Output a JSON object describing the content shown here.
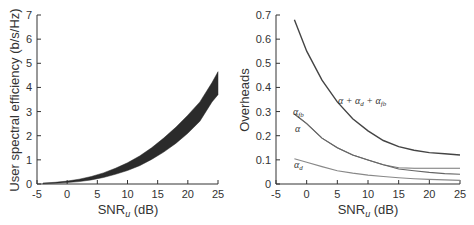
{
  "chart_data": [
    {
      "type": "area",
      "title": "",
      "xlabel": "SNR_u (dB)",
      "ylabel": "User spectral efficiency (b/s/Hz)",
      "xlim": [
        -5,
        25
      ],
      "ylim": [
        0,
        7
      ],
      "xticks": [
        -5,
        0,
        5,
        10,
        15,
        20,
        25
      ],
      "yticks": [
        0,
        1,
        2,
        3,
        4,
        5,
        6,
        7
      ],
      "grid": false,
      "legend": null,
      "x": [
        -4,
        -2,
        0,
        2,
        4,
        6,
        8,
        10,
        12,
        14,
        16,
        18,
        20,
        22,
        24,
        25
      ],
      "series": [
        {
          "name": "upper bound",
          "values": [
            0.04,
            0.07,
            0.12,
            0.2,
            0.31,
            0.46,
            0.65,
            0.88,
            1.16,
            1.5,
            1.9,
            2.35,
            2.85,
            3.4,
            4.2,
            4.65
          ]
        },
        {
          "name": "lower bound",
          "values": [
            0.01,
            0.03,
            0.06,
            0.1,
            0.17,
            0.27,
            0.4,
            0.56,
            0.76,
            1.02,
            1.32,
            1.68,
            2.1,
            2.6,
            3.4,
            3.7
          ]
        }
      ]
    },
    {
      "type": "line",
      "title": "",
      "xlabel": "SNR_u (dB)",
      "ylabel": "Overheads",
      "xlim": [
        -5,
        25
      ],
      "ylim": [
        0,
        0.7
      ],
      "xticks": [
        -5,
        0,
        5,
        10,
        15,
        20,
        25
      ],
      "yticks": [
        0,
        0.1,
        0.2,
        0.3,
        0.4,
        0.5,
        0.6,
        0.7
      ],
      "grid": false,
      "legend": null,
      "x": [
        -2,
        0,
        2.5,
        5,
        7.5,
        10,
        12.5,
        15,
        17.5,
        20,
        22.5,
        25
      ],
      "series": [
        {
          "name": "α + α_d + α_fb",
          "values": [
            0.68,
            0.55,
            0.43,
            0.34,
            0.27,
            0.22,
            0.18,
            0.155,
            0.14,
            0.13,
            0.125,
            0.12
          ]
        },
        {
          "name": "α_fb",
          "values": [
            0.29,
            0.25,
            0.19,
            0.15,
            0.12,
            0.1,
            0.08,
            0.067,
            0.065,
            0.065,
            0.065,
            0.065
          ]
        },
        {
          "name": "α",
          "values": [
            0.29,
            0.25,
            0.19,
            0.15,
            0.12,
            0.1,
            0.08,
            0.062,
            0.055,
            0.048,
            0.043,
            0.04
          ]
        },
        {
          "name": "α_d",
          "values": [
            0.105,
            0.09,
            0.072,
            0.055,
            0.045,
            0.037,
            0.031,
            0.026,
            0.022,
            0.019,
            0.017,
            0.015
          ]
        }
      ],
      "annotations": [
        "α + α_d + α_fb",
        "α_fb",
        "α",
        "α_d"
      ]
    }
  ],
  "left": {
    "ylabel": "User spectral efficiency (b/s/Hz)",
    "xlabel_main": "SNR",
    "xlabel_sub": "u",
    "xlabel_unit": " (dB)",
    "xticks": [
      "-5",
      "0",
      "5",
      "10",
      "15",
      "20",
      "25"
    ],
    "yticks": [
      "0",
      "1",
      "2",
      "3",
      "4",
      "5",
      "6",
      "7"
    ]
  },
  "right": {
    "ylabel": "Overheads",
    "xlabel_main": "SNR",
    "xlabel_sub": "u",
    "xlabel_unit": " (dB)",
    "xticks": [
      "-5",
      "0",
      "5",
      "10",
      "15",
      "20",
      "25"
    ],
    "yticks": [
      "0",
      "0.1",
      "0.2",
      "0.3",
      "0.4",
      "0.5",
      "0.6",
      "0.7"
    ],
    "annotations": {
      "total": "α + α",
      "total_d": "d",
      "total_plus": " + α",
      "total_fb": "fb",
      "afb": "α",
      "afb_sub": "fb",
      "a": "α",
      "ad": "α",
      "ad_sub": "d"
    }
  }
}
